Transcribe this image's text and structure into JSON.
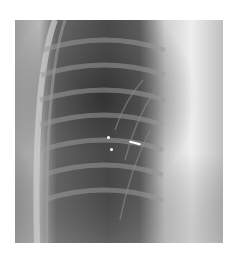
{
  "image": {
    "subject": "Chest radiograph, right hemithorax, frontal view",
    "alt": "Chest X-ray showing ribs, lung field and mediastinal border with two white arrows marking a finding near the hilum",
    "annotations": [
      {
        "type": "arrow",
        "direction": "vertical double-headed (dashed)",
        "position": "left-center"
      },
      {
        "type": "arrow",
        "direction": "horizontal double-headed",
        "position": "center"
      }
    ],
    "colors": {
      "background": "#ffffff",
      "lung_dark": "#3a3a3a",
      "soft_tissue": "#9a9a9a",
      "mediastinum": "#e8e8e8",
      "marker": "#ffffff"
    }
  }
}
